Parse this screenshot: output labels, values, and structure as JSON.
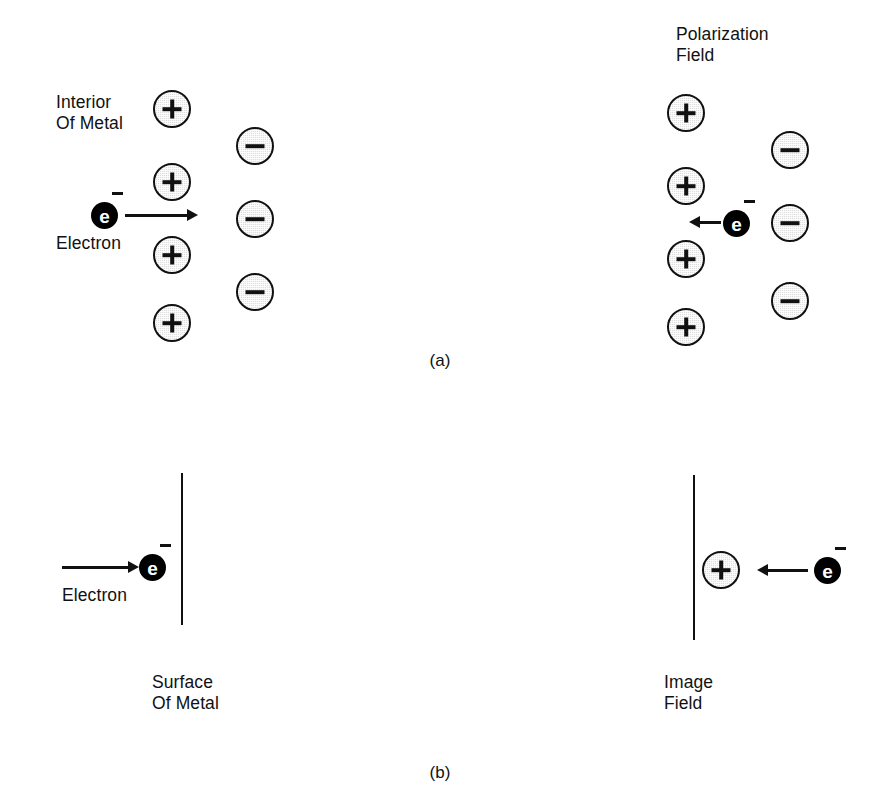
{
  "figure": {
    "background_color": "#ffffff",
    "ink_color": "#111111",
    "ion_fill_color": "#dedede",
    "electron_fill_color": "#000000",
    "width": 880,
    "height": 802
  },
  "panel_a": {
    "caption": "(a)",
    "left": {
      "interior_label": "Interior\nOf Metal",
      "electron_label": "Electron",
      "electron_symbol": "e",
      "electron_charge": "−",
      "arrow_direction": "right",
      "positive_ions": [
        {
          "symbol": "+",
          "x": 172,
          "y": 109
        },
        {
          "symbol": "+",
          "x": 172,
          "y": 182
        },
        {
          "symbol": "+",
          "x": 172,
          "y": 255
        },
        {
          "symbol": "+",
          "x": 172,
          "y": 323
        }
      ],
      "negative_ions": [
        {
          "symbol": "−",
          "x": 255,
          "y": 146
        },
        {
          "symbol": "−",
          "x": 255,
          "y": 219
        },
        {
          "symbol": "−",
          "x": 255,
          "y": 292
        }
      ],
      "electron_position": {
        "x": 104,
        "y": 215
      }
    },
    "right": {
      "polarization_label": "Polarization\nField",
      "electron_symbol": "e",
      "electron_charge": "−",
      "arrow_direction": "left",
      "positive_ions": [
        {
          "symbol": "+",
          "x": 686,
          "y": 113
        },
        {
          "symbol": "+",
          "x": 686,
          "y": 186
        },
        {
          "symbol": "+",
          "x": 686,
          "y": 259
        },
        {
          "symbol": "+",
          "x": 686,
          "y": 327
        }
      ],
      "negative_ions": [
        {
          "symbol": "−",
          "x": 790,
          "y": 150
        },
        {
          "symbol": "−",
          "x": 790,
          "y": 223
        },
        {
          "symbol": "−",
          "x": 790,
          "y": 301
        }
      ],
      "electron_position": {
        "x": 736,
        "y": 223
      }
    }
  },
  "panel_b": {
    "caption": "(b)",
    "left": {
      "electron_label": "Electron",
      "surface_label": "Surface\nOf Metal",
      "electron_symbol": "e",
      "electron_charge": "−",
      "arrow_direction": "right",
      "electron_position": {
        "x": 152,
        "y": 567
      },
      "surface_line": {
        "x": 182,
        "y_top": 473,
        "y_bottom": 625
      }
    },
    "right": {
      "image_field_label": "Image\nField",
      "electron_symbol": "e",
      "electron_charge": "−",
      "arrow_direction": "left",
      "positive_ion": {
        "symbol": "+",
        "x": 721,
        "y": 570
      },
      "electron_position": {
        "x": 827,
        "y": 570
      },
      "surface_line": {
        "x": 694,
        "y_top": 475,
        "y_bottom": 640
      }
    }
  }
}
